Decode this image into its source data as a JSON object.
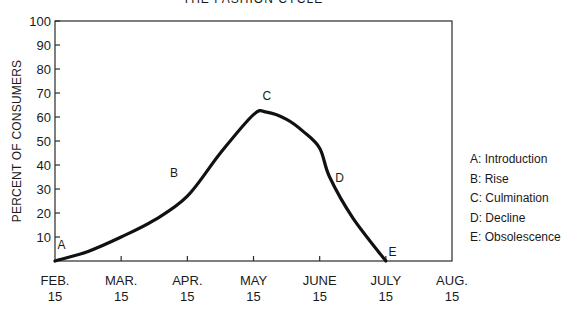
{
  "chart_data": {
    "type": "line",
    "title": "THE FASHION CYCLE",
    "xlabel": "",
    "ylabel": "PERCENT OF CONSUMERS",
    "ylim": [
      0,
      100
    ],
    "yticks": [
      10,
      20,
      30,
      40,
      50,
      60,
      70,
      80,
      90,
      100
    ],
    "categories": [
      "FEB. 15",
      "MAR. 15",
      "APR. 15",
      "MAY 15",
      "JUNE 15",
      "JULY 15",
      "AUG. 15"
    ],
    "x_tick_lines": [
      [
        "FEB.",
        "15"
      ],
      [
        "MAR.",
        "15"
      ],
      [
        "APR.",
        "15"
      ],
      [
        "MAY",
        "15"
      ],
      [
        "JUNE",
        "15"
      ],
      [
        "JULY",
        "15"
      ],
      [
        "AUG.",
        "15"
      ]
    ],
    "grid": false,
    "series": [
      {
        "name": "Fashion cycle",
        "x": [
          0,
          0.5,
          1,
          1.5,
          2,
          2.5,
          3,
          3.2,
          3.5,
          3.75,
          4,
          4.15,
          4.5,
          5
        ],
        "values": [
          0,
          4,
          10,
          17,
          27,
          45,
          61,
          62,
          59,
          54,
          47,
          35,
          18,
          0
        ]
      }
    ],
    "annotations": [
      {
        "label": "A",
        "x": 0.1,
        "y": 5,
        "stage": "Introduction"
      },
      {
        "label": "B",
        "x": 1.8,
        "y": 35,
        "stage": "Rise"
      },
      {
        "label": "C",
        "x": 3.2,
        "y": 67,
        "stage": "Culmination"
      },
      {
        "label": "D",
        "x": 4.3,
        "y": 33,
        "stage": "Decline"
      },
      {
        "label": "E",
        "x": 5.1,
        "y": 2,
        "stage": "Obsolescence"
      }
    ],
    "legend_position": "right",
    "legend": [
      "A: Introduction",
      "B: Rise",
      "C: Culmination",
      "D: Decline",
      "E: Obsolescence"
    ]
  }
}
